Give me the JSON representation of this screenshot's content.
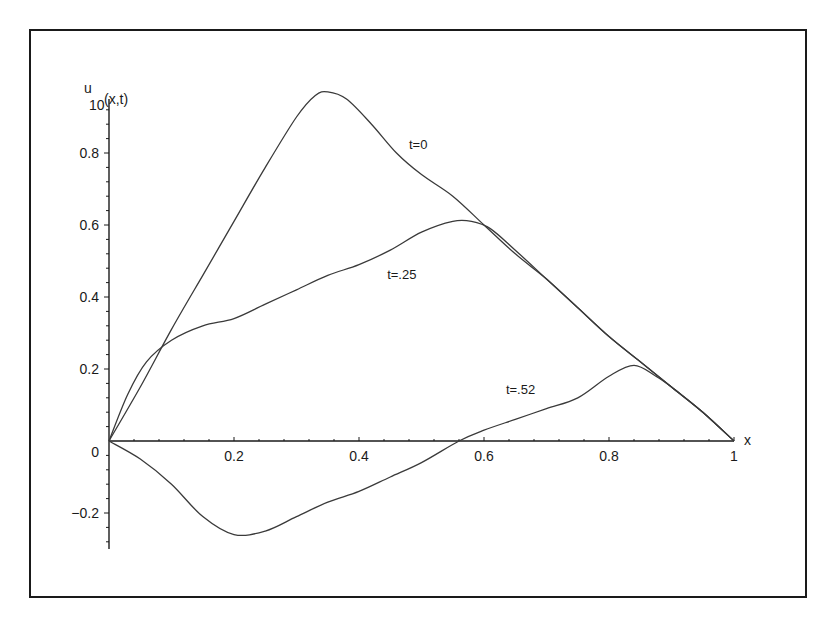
{
  "chart_data": {
    "type": "line",
    "title": "",
    "xlabel": "x",
    "ylabel": "u",
    "ylabel_subscript": "10",
    "ylabel_suffix": "(x,t)",
    "xlim": [
      0,
      1
    ],
    "ylim": [
      -0.3,
      1.0
    ],
    "grid": false,
    "legend": "none (inline curve labels)",
    "x_ticks": [
      "0.2",
      "0.4",
      "0.6",
      "0.8",
      "1"
    ],
    "y_ticks": [
      "0",
      "0.2",
      "0.4",
      "0.6",
      "0.8",
      "-0.2"
    ],
    "origin_label": "0",
    "series": [
      {
        "name": "t=0",
        "label": "t=0",
        "x": [
          0,
          0.05,
          0.1,
          0.15,
          0.2,
          0.25,
          0.3,
          0.33,
          0.35,
          0.38,
          0.42,
          0.46,
          0.5,
          0.55,
          0.6,
          0.65,
          0.7,
          0.75,
          0.8,
          0.85,
          0.9,
          0.95,
          1.0
        ],
        "y": [
          0,
          0.15,
          0.31,
          0.46,
          0.61,
          0.76,
          0.9,
          0.96,
          0.97,
          0.95,
          0.88,
          0.8,
          0.74,
          0.68,
          0.6,
          0.52,
          0.45,
          0.37,
          0.29,
          0.22,
          0.15,
          0.08,
          0
        ]
      },
      {
        "name": "t=.25",
        "label": "t=.25",
        "x": [
          0,
          0.03,
          0.06,
          0.1,
          0.15,
          0.2,
          0.25,
          0.3,
          0.35,
          0.4,
          0.45,
          0.5,
          0.55,
          0.58,
          0.61,
          0.65,
          0.7,
          0.75,
          0.8,
          0.85,
          0.9,
          0.95,
          1.0
        ],
        "y": [
          0,
          0.13,
          0.22,
          0.28,
          0.32,
          0.34,
          0.38,
          0.42,
          0.46,
          0.49,
          0.53,
          0.58,
          0.61,
          0.61,
          0.59,
          0.53,
          0.45,
          0.37,
          0.29,
          0.22,
          0.15,
          0.08,
          0
        ]
      },
      {
        "name": "t=.52",
        "label": "t=.52",
        "x": [
          0,
          0.05,
          0.1,
          0.15,
          0.2,
          0.25,
          0.3,
          0.35,
          0.4,
          0.45,
          0.5,
          0.56,
          0.6,
          0.65,
          0.7,
          0.75,
          0.8,
          0.84,
          0.875,
          0.9,
          0.95,
          1.0
        ],
        "y": [
          0,
          -0.05,
          -0.12,
          -0.21,
          -0.26,
          -0.25,
          -0.21,
          -0.17,
          -0.14,
          -0.1,
          -0.06,
          0.0,
          0.03,
          0.06,
          0.09,
          0.12,
          0.18,
          0.21,
          0.18,
          0.15,
          0.08,
          0
        ]
      }
    ],
    "annotations": [
      {
        "text": "t=0",
        "x": 0.48,
        "y": 0.81
      },
      {
        "text": "t=.25",
        "x": 0.445,
        "y": 0.45
      },
      {
        "text": "t=.52",
        "x": 0.635,
        "y": 0.13
      }
    ]
  }
}
